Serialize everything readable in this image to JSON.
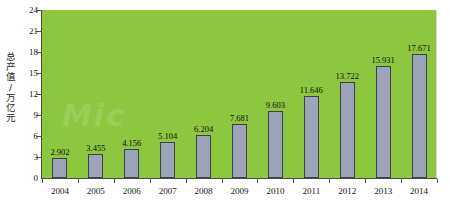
{
  "chart_data": {
    "type": "bar",
    "title": "",
    "xlabel": "",
    "ylabel": "总产值/万亿元",
    "categories": [
      "2004",
      "2005",
      "2006",
      "2007",
      "2008",
      "2009",
      "2010",
      "2011",
      "2012",
      "2013",
      "2014"
    ],
    "values": [
      2.902,
      3.455,
      4.156,
      5.104,
      6.204,
      7.681,
      9.603,
      11.646,
      13.722,
      15.931,
      17.671
    ],
    "value_labels": [
      "2.902",
      "3.455",
      "4.156",
      "5.104",
      "6.204",
      "7.681",
      "9.603",
      "11.646",
      "13.722",
      "15.931",
      "17.671"
    ],
    "ylim": [
      0,
      24
    ],
    "yticks": [
      0,
      3,
      6,
      9,
      12,
      15,
      18,
      21,
      24
    ],
    "ytick_labels": [
      "0",
      "3",
      "6",
      "9",
      "12",
      "15",
      "18",
      "21",
      "24"
    ],
    "grid": false,
    "legend": null,
    "colors": {
      "plot_background": "#8dc63f",
      "bar_fill": "#9ba4b9",
      "bar_border": "#3d3f4a",
      "axis": "#4b4b4b",
      "text": "#111111",
      "page_background": "#ffffff"
    },
    "watermark_text": "Mic"
  }
}
